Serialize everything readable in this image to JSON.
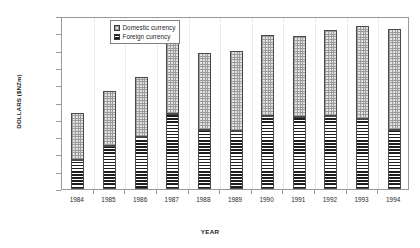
{
  "chart_data": {
    "type": "bar",
    "subtype": "stacked-vertical",
    "title": "",
    "xlabel": "YEAR",
    "ylabel": "DOLLARS ($NZm)",
    "categories": [
      "1984",
      "1985",
      "1986",
      "1987",
      "1988",
      "1989",
      "1990",
      "1991",
      "1992",
      "1993",
      "1994"
    ],
    "series": [
      {
        "name": "Foreign currency",
        "pattern": "horizontal-lines",
        "color": "#1e1e1e",
        "values": [
          8400,
          12300,
          15000,
          21700,
          17100,
          16700,
          21000,
          20700,
          21000,
          20200,
          17100
        ]
      },
      {
        "name": "Domestic currency",
        "pattern": "fine-dots",
        "color": "#e4e4e4",
        "values": [
          13600,
          16100,
          17300,
          20800,
          22100,
          23300,
          23600,
          23500,
          25000,
          27000,
          29200
        ]
      }
    ],
    "totals": [
      22000,
      28400,
      32300,
      42500,
      39200,
      40000,
      44600,
      44200,
      46000,
      47200,
      46300
    ],
    "ylim": [
      0,
      50000
    ],
    "yticks": [
      0,
      5000,
      10000,
      15000,
      20000,
      25000,
      30000,
      35000,
      40000,
      45000,
      50000
    ],
    "ytick_labels": [
      "0",
      "5000",
      "10000",
      "15000",
      "20000",
      "25000",
      "30000",
      "35000",
      "40000",
      "45000",
      "50000"
    ],
    "grid": false,
    "legend_position": "top-left-inside",
    "legend_entries": [
      "Domestic currency",
      "Foreign currency"
    ]
  }
}
